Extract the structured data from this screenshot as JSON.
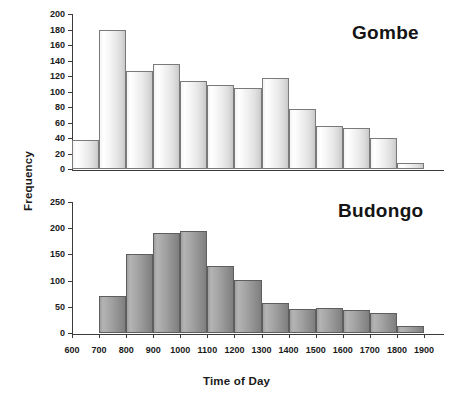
{
  "figure": {
    "xlabel": "Time of Day",
    "ylabel": "Frequency"
  },
  "chart_data": [
    {
      "type": "bar",
      "title": "Gombe",
      "xlabel": "Time of Day",
      "ylabel": "Frequency",
      "ylim": [
        0,
        200
      ],
      "ytick_step": 20,
      "yticks": [
        0,
        20,
        40,
        60,
        80,
        100,
        120,
        140,
        160,
        180,
        200
      ],
      "xticks": [
        600,
        700,
        800,
        900,
        1000,
        1100,
        1200,
        1300,
        1400,
        1500,
        1600,
        1700,
        1800,
        1900
      ],
      "xlim": [
        600,
        1900
      ],
      "grid": false,
      "legend": "none",
      "bar_style": "light-gradient",
      "bin_width": 100,
      "bin_starts": [
        600,
        700,
        800,
        900,
        1000,
        1100,
        1200,
        1300,
        1400,
        1500,
        1600,
        1700,
        1800
      ],
      "categories": [
        "600-700",
        "700-800",
        "800-900",
        "900-1000",
        "1000-1100",
        "1100-1200",
        "1200-1300",
        "1300-1400",
        "1400-1500",
        "1500-1600",
        "1600-1700",
        "1700-1800",
        "1800-1900"
      ],
      "values": [
        38,
        179,
        127,
        135,
        113,
        109,
        105,
        117,
        77,
        56,
        53,
        40,
        8
      ]
    },
    {
      "type": "bar",
      "title": "Budongo",
      "xlabel": "Time of Day",
      "ylabel": "Frequency",
      "ylim": [
        0,
        250
      ],
      "ytick_step": 50,
      "yticks": [
        0,
        50,
        100,
        150,
        200,
        250
      ],
      "xticks": [
        600,
        700,
        800,
        900,
        1000,
        1100,
        1200,
        1300,
        1400,
        1500,
        1600,
        1700,
        1800,
        1900
      ],
      "xlim": [
        600,
        1900
      ],
      "grid": false,
      "legend": "none",
      "bar_style": "dark-gradient",
      "bin_width": 100,
      "bin_starts": [
        700,
        800,
        900,
        1000,
        1100,
        1200,
        1300,
        1400,
        1500,
        1600,
        1700,
        1800
      ],
      "categories": [
        "700-800",
        "800-900",
        "900-1000",
        "1000-1100",
        "1100-1200",
        "1200-1300",
        "1300-1400",
        "1400-1500",
        "1500-1600",
        "1600-1700",
        "1700-1800",
        "1800-1900"
      ],
      "values": [
        70,
        150,
        190,
        195,
        128,
        102,
        58,
        45,
        48,
        44,
        38,
        14
      ]
    }
  ],
  "colors": {
    "axis": "#3b3b3b",
    "text": "#1a1a1a",
    "bar_light_edge": "#7a7a7a",
    "bar_dark_edge": "#5e5e5e"
  }
}
